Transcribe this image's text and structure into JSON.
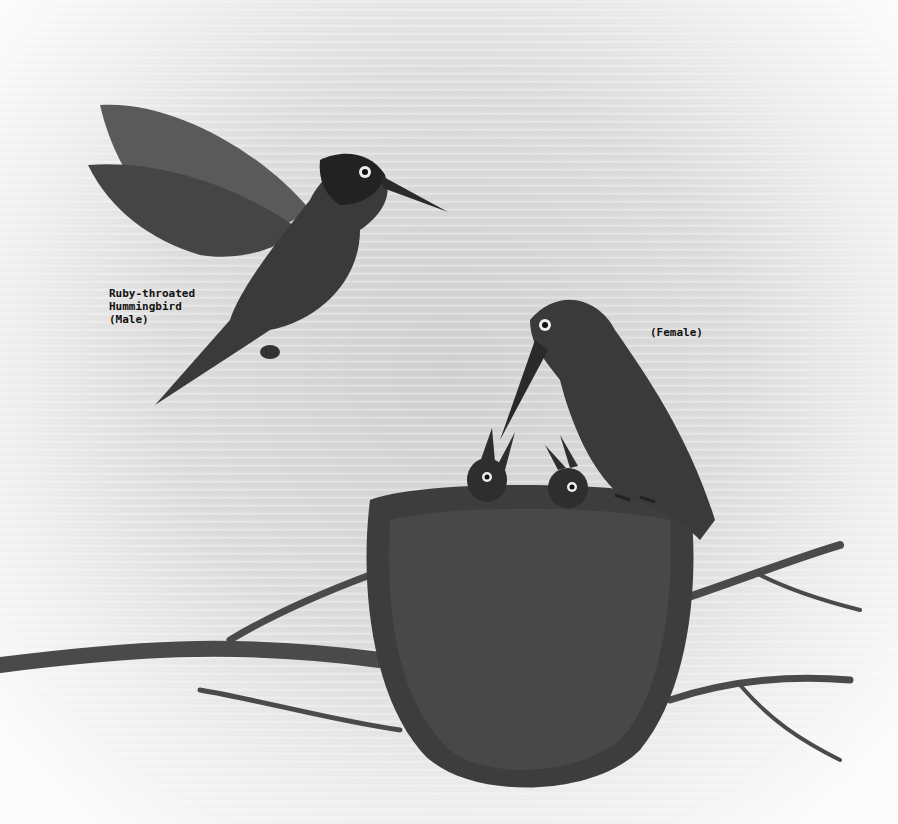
{
  "image": {
    "description": "Black and white illustration of Ruby-throated Hummingbirds: a hovering male, a female perched on a nest feeding two chicks, on a branch",
    "labels": {
      "male": "Ruby-throated\nHummingbird\n(Male)",
      "female": "(Female)"
    },
    "colors": {
      "background": "#e6e6e6",
      "bird_dark": "#2a2a2a",
      "nest": "#3a3a3a",
      "branch": "#4a4a4a"
    }
  }
}
